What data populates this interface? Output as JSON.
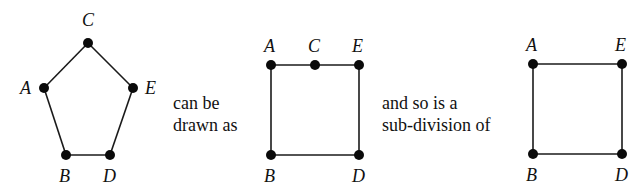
{
  "figure": {
    "captions": {
      "first_line1": "can be",
      "first_line2": "drawn as",
      "second_line1": "and so is a",
      "second_line2": "sub-division of"
    },
    "graphs": [
      {
        "name": "pentagon",
        "vertices": [
          {
            "id": "C",
            "label": "C",
            "x": 88,
            "y": 43,
            "lx": 82,
            "ly": 26
          },
          {
            "id": "A",
            "label": "A",
            "x": 44,
            "y": 88,
            "lx": 20,
            "ly": 94
          },
          {
            "id": "E",
            "label": "E",
            "x": 133,
            "y": 88,
            "lx": 145,
            "ly": 94
          },
          {
            "id": "B",
            "label": "B",
            "x": 66,
            "y": 155,
            "lx": 59,
            "ly": 182
          },
          {
            "id": "D",
            "label": "D",
            "x": 110,
            "y": 155,
            "lx": 103,
            "ly": 182
          }
        ],
        "edges": [
          [
            "C",
            "A"
          ],
          [
            "A",
            "B"
          ],
          [
            "B",
            "D"
          ],
          [
            "D",
            "E"
          ],
          [
            "E",
            "C"
          ]
        ]
      },
      {
        "name": "subdivided-square",
        "vertices": [
          {
            "id": "A",
            "label": "A",
            "x": 271,
            "y": 65,
            "lx": 264,
            "ly": 52
          },
          {
            "id": "C",
            "label": "C",
            "x": 315,
            "y": 65,
            "lx": 308,
            "ly": 52
          },
          {
            "id": "E",
            "label": "E",
            "x": 359,
            "y": 65,
            "lx": 352,
            "ly": 52
          },
          {
            "id": "B",
            "label": "B",
            "x": 271,
            "y": 155,
            "lx": 264,
            "ly": 182
          },
          {
            "id": "D",
            "label": "D",
            "x": 359,
            "y": 155,
            "lx": 352,
            "ly": 182
          }
        ],
        "edges": [
          [
            "A",
            "C"
          ],
          [
            "C",
            "E"
          ],
          [
            "E",
            "D"
          ],
          [
            "D",
            "B"
          ],
          [
            "B",
            "A"
          ]
        ]
      },
      {
        "name": "square",
        "vertices": [
          {
            "id": "A",
            "label": "A",
            "x": 533,
            "y": 64,
            "lx": 526,
            "ly": 51
          },
          {
            "id": "E",
            "label": "E",
            "x": 622,
            "y": 64,
            "lx": 615,
            "ly": 51
          },
          {
            "id": "B",
            "label": "B",
            "x": 533,
            "y": 154,
            "lx": 526,
            "ly": 181
          },
          {
            "id": "D",
            "label": "D",
            "x": 622,
            "y": 154,
            "lx": 615,
            "ly": 181
          }
        ],
        "edges": [
          [
            "A",
            "E"
          ],
          [
            "E",
            "D"
          ],
          [
            "D",
            "B"
          ],
          [
            "B",
            "A"
          ]
        ]
      }
    ]
  }
}
